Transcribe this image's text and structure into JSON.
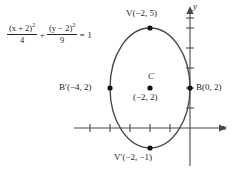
{
  "figure": {
    "colors": {
      "curve": "#4a4a4a",
      "axis": "#4a4a4a",
      "text": "#262626",
      "point": "#111111",
      "background": "#ffffff"
    },
    "equation": {
      "numerator_1": "(x + 2)",
      "numerator_1_exp": "2",
      "denominator_1": "4",
      "operator": "+",
      "numerator_2": "(y − 2)",
      "numerator_2_exp": "2",
      "denominator_2": "9",
      "equals": "=",
      "right_hand_side": "1",
      "plain_text": "(x + 2)^2 / 4 + (y - 2)^2 / 9 = 1"
    },
    "axes": {
      "x_label": "x",
      "y_label": "y",
      "origin_px": {
        "x": 190,
        "y": 128
      },
      "unit_px": 20,
      "x_ticks": [
        -5,
        -4,
        -3,
        -2,
        -1
      ],
      "y_ticks": [
        1,
        2,
        3,
        4,
        5,
        6
      ]
    },
    "ellipse": {
      "center": {
        "x": -2,
        "y": 2
      },
      "semi_axis_a": 2,
      "semi_axis_b": 3,
      "orientation": "vertical"
    },
    "points": [
      {
        "name": "vertex-top",
        "label_main": "V",
        "label_coords": "(−2, 5)",
        "x": -2,
        "y": 5
      },
      {
        "name": "vertex-bottom",
        "label_main": "V′",
        "label_coords": "(−2, −1)",
        "x": -2,
        "y": -1
      },
      {
        "name": "covertex-left",
        "label_main": "B′",
        "label_coords": "(−4, 2)",
        "x": -4,
        "y": 2
      },
      {
        "name": "covertex-right",
        "label_main": "B",
        "label_coords": "(0, 2)",
        "x": 0,
        "y": 2
      },
      {
        "name": "center",
        "label_main": "C",
        "label_coords": "(−2, 2)",
        "x": -2,
        "y": 2
      }
    ],
    "labels": {
      "vertex_top": "V(−2, 5)",
      "vertex_bottom": "V′(−2, −1)",
      "covertex_left": "B′(−4, 2)",
      "covertex_right": "B(0, 2)",
      "center_letter": "C",
      "center_coords": "(−2, 2)"
    }
  }
}
